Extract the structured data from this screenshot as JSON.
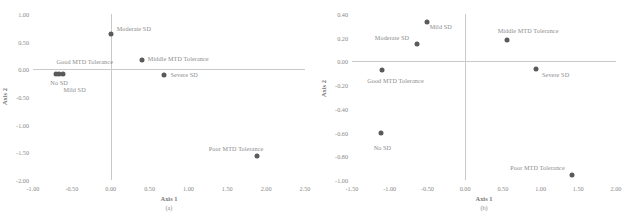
{
  "figure": {
    "background": "#ffffff",
    "point_color": "#5a5a5a",
    "text_color": "#8a8a8a",
    "axis_color": "#c9c9c9"
  },
  "chart_data": [
    {
      "type": "scatter",
      "panel": "a",
      "caption": "(a)",
      "title": "",
      "xlabel": "Axis 1",
      "ylabel": "Axis 2",
      "xlim": [
        -1.0,
        2.5
      ],
      "ylim": [
        -2.0,
        1.0
      ],
      "xticks": [
        "-1.00",
        "-0.50",
        "0.00",
        "0.50",
        "1.00",
        "1.50",
        "2.00",
        "2.50"
      ],
      "xtick_values": [
        -1.0,
        -0.5,
        0.0,
        0.5,
        1.0,
        1.5,
        2.0,
        2.5
      ],
      "yticks": [
        "1.00",
        "0.50",
        "0.00",
        "-0.50",
        "-1.00",
        "-1.50",
        "-2.00"
      ],
      "ytick_values": [
        1.0,
        0.5,
        0.0,
        -0.5,
        -1.0,
        -1.5,
        -2.0
      ],
      "grid": false,
      "legend": "none",
      "points": [
        {
          "label": "Moderate SD",
          "x": 0.0,
          "y": 0.64,
          "label_dx": 6,
          "label_dy": -5
        },
        {
          "label": "Middle MTD Tolerance",
          "x": 0.4,
          "y": 0.17,
          "label_dx": 6,
          "label_dy": -1
        },
        {
          "label": "Good MTD Tolerance",
          "x": -0.66,
          "y": -0.08,
          "label_dx": -3,
          "label_dy": -12
        },
        {
          "label": "No SD",
          "x": -0.7,
          "y": -0.09,
          "label_dx": -6,
          "label_dy": 9
        },
        {
          "label": "Mild SD",
          "x": -0.62,
          "y": -0.08,
          "label_dx": 1,
          "label_dy": 16
        },
        {
          "label": "Severe SD",
          "x": 0.68,
          "y": -0.11,
          "label_dx": 7,
          "label_dy": 0
        },
        {
          "label": "Poor MTD Tolerance",
          "x": 1.88,
          "y": -1.56,
          "label_dx": -48,
          "label_dy": -7
        }
      ]
    },
    {
      "type": "scatter",
      "panel": "b",
      "caption": "(b)",
      "title": "",
      "xlabel": "Axis 1",
      "ylabel": "Axis 2",
      "xlim": [
        -1.5,
        2.0
      ],
      "ylim": [
        -1.0,
        0.4
      ],
      "xticks": [
        "-1.50",
        "-1.00",
        "-0.50",
        "0.00",
        "0.50",
        "1.00",
        "1.50",
        "2.00"
      ],
      "xtick_values": [
        -1.5,
        -1.0,
        -0.5,
        0.0,
        0.5,
        1.0,
        1.5,
        2.0
      ],
      "yticks": [
        "0.40",
        "0.20",
        "0.00",
        "-0.20",
        "-0.40",
        "-0.60",
        "-0.80",
        "-1.00"
      ],
      "ytick_values": [
        0.4,
        0.2,
        0.0,
        -0.2,
        -0.4,
        -0.6,
        -0.8,
        -1.0
      ],
      "grid": false,
      "legend": "none",
      "points": [
        {
          "label": "Mild SD",
          "x": -0.51,
          "y": 0.33,
          "label_dx": 3,
          "label_dy": 5
        },
        {
          "label": "Moderate SD",
          "x": -0.64,
          "y": 0.15,
          "label_dx": -42,
          "label_dy": -6
        },
        {
          "label": "Middle MTD Tolerance",
          "x": 0.55,
          "y": 0.18,
          "label_dx": -9,
          "label_dy": -9
        },
        {
          "label": "Good MTD Tolerance",
          "x": -1.1,
          "y": -0.07,
          "label_dx": -15,
          "label_dy": 11
        },
        {
          "label": "Severe SD",
          "x": 0.94,
          "y": -0.06,
          "label_dx": 6,
          "label_dy": 6
        },
        {
          "label": "No SD",
          "x": -1.12,
          "y": -0.6,
          "label_dx": -7,
          "label_dy": 15
        },
        {
          "label": "Poor MTD Tolerance",
          "x": 1.42,
          "y": -0.96,
          "label_dx": -62,
          "label_dy": -7
        }
      ]
    }
  ]
}
